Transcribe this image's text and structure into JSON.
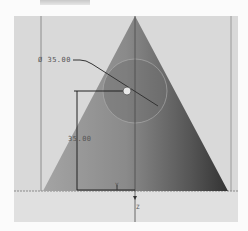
{
  "toolbar": {
    "tab_label": ""
  },
  "viewport": {
    "shape": "cone",
    "dimensions": {
      "diameter_label": "Ø 35.00",
      "height_label": "35.00"
    },
    "axes": {
      "y_label": "Y",
      "z_label": "Z"
    },
    "base_caption": "",
    "colors": {
      "background": "#d9d9d9",
      "cone_light": "#9a9a9a",
      "cone_dark": "#3a3a3a",
      "selection_circle": "#7a7a7a"
    }
  }
}
